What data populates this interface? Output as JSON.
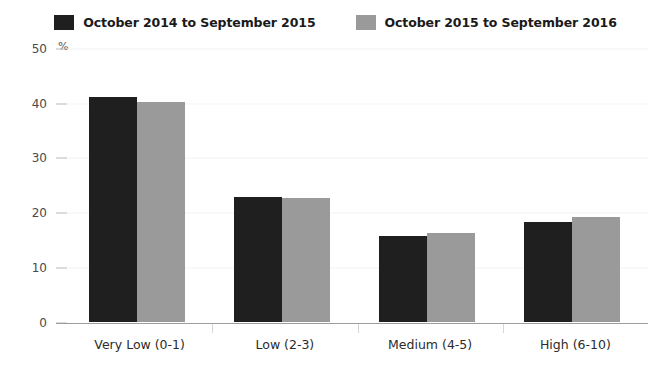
{
  "legend": {
    "items": [
      {
        "label": "October 2014 to September 2015",
        "color": "#1f1f1f",
        "swatch_name": "legend-swatch-series-1"
      },
      {
        "label": "October 2015 to September 2016",
        "color": "#9a9a9a",
        "swatch_name": "legend-swatch-series-2"
      }
    ]
  },
  "axis": {
    "unit": "%",
    "y_ticks": [
      "0",
      "10",
      "20",
      "30",
      "40",
      "50"
    ]
  },
  "chart_data": {
    "type": "bar",
    "title": "",
    "subtitle": "",
    "xlabel": "",
    "ylabel": "%",
    "ylim": [
      0,
      50
    ],
    "ytick_values": [
      0,
      10,
      20,
      30,
      40,
      50
    ],
    "grid": true,
    "legend_position": "top-center",
    "categories": [
      "Very Low (0-1)",
      "Low (2-3)",
      "Medium (4-5)",
      "High (6-10)"
    ],
    "series": [
      {
        "name": "October 2014 to September 2015",
        "color": "#1f1f1f",
        "values": [
          41.2,
          22.9,
          15.9,
          18.4
        ]
      },
      {
        "name": "October 2015 to September 2016",
        "color": "#9a9a9a",
        "values": [
          40.3,
          22.8,
          16.4,
          19.2
        ]
      }
    ]
  }
}
